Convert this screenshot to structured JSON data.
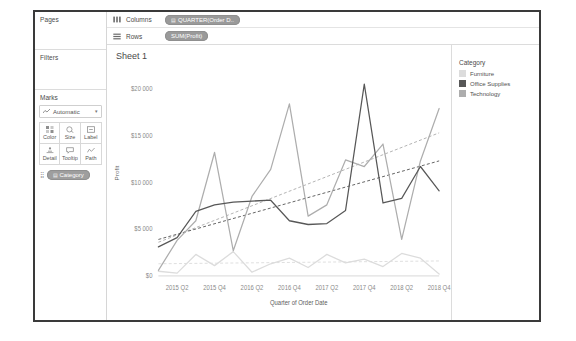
{
  "left_panel": {
    "pages_label": "Pages",
    "filters_label": "Filters",
    "marks_label": "Marks",
    "mark_type": "Automatic",
    "mark_type_icon": "line-mark-icon",
    "buttons": [
      {
        "label": "Color",
        "icon": "color-icon"
      },
      {
        "label": "Size",
        "icon": "size-icon"
      },
      {
        "label": "Label",
        "icon": "label-icon"
      },
      {
        "label": "Detail",
        "icon": "detail-icon"
      },
      {
        "label": "Tooltip",
        "icon": "tooltip-icon"
      },
      {
        "label": "Path",
        "icon": "path-icon"
      }
    ],
    "mark_pill": {
      "label": "Category",
      "icon": "dimension-icon",
      "handle_icon": "drag-handle-icon"
    }
  },
  "shelves": {
    "columns": {
      "name": "Columns",
      "icon": "columns-icon",
      "pill": "QUARTER(Order D..",
      "pill_icon": "date-icon"
    },
    "rows": {
      "name": "Rows",
      "icon": "rows-icon",
      "pill": "SUM(Profit)",
      "pill_icon": "measure-icon"
    }
  },
  "view": {
    "sheet_title": "Sheet 1"
  },
  "legend": {
    "title": "Category",
    "items": [
      {
        "label": "Furniture",
        "color": "#dcdcdc"
      },
      {
        "label": "Office Supplies",
        "color": "#575757"
      },
      {
        "label": "Technology",
        "color": "#adadad"
      }
    ]
  },
  "chart_data": {
    "type": "line",
    "title": "Sheet 1",
    "xlabel": "Quarter of Order Date",
    "ylabel": "Profit",
    "ylim": [
      0,
      22000
    ],
    "yticks": [
      0,
      5000,
      10000,
      15000,
      20000
    ],
    "ytick_labels": [
      "$0",
      "$5 000",
      "$10 000",
      "$15 000",
      "$20 000"
    ],
    "grid": false,
    "legend_position": "right",
    "x": [
      "2015 Q1",
      "2015 Q2",
      "2015 Q3",
      "2015 Q4",
      "2016 Q1",
      "2016 Q2",
      "2016 Q3",
      "2016 Q4",
      "2017 Q1",
      "2017 Q2",
      "2017 Q3",
      "2017 Q4",
      "2018 Q1",
      "2018 Q2",
      "2018 Q3",
      "2018 Q4"
    ],
    "xtick_labels": [
      "2015 Q2",
      "2015 Q4",
      "2016 Q2",
      "2016 Q4",
      "2017 Q2",
      "2017 Q4",
      "2018 Q2",
      "2018 Q4"
    ],
    "series": [
      {
        "name": "Furniture",
        "color": "#dcdcdc",
        "values": [
          500,
          300,
          2300,
          1100,
          2600,
          400,
          1300,
          1900,
          900,
          2300,
          1400,
          1800,
          1000,
          2400,
          1900,
          200
        ]
      },
      {
        "name": "Office Supplies",
        "color": "#575757",
        "values": [
          3100,
          4100,
          6900,
          7600,
          7900,
          8000,
          8100,
          5900,
          5500,
          5600,
          7000,
          20500,
          7800,
          8300,
          11700,
          9100
        ]
      },
      {
        "name": "Technology",
        "color": "#adadad",
        "values": [
          600,
          3800,
          5900,
          13200,
          2700,
          8500,
          11400,
          18400,
          6400,
          7600,
          12400,
          11700,
          14100,
          3900,
          12300,
          17900
        ]
      }
    ],
    "trend_lines": [
      {
        "name": "Technology trend",
        "color": "#adadad",
        "style": "dashed",
        "y_start": 3600,
        "y_end": 15300
      },
      {
        "name": "Office Supplies trend",
        "color": "#575757",
        "style": "dashed",
        "y_start": 3900,
        "y_end": 12300
      },
      {
        "name": "Furniture trend",
        "color": "#dcdcdc",
        "style": "dashed",
        "y_start": 1300,
        "y_end": 1600
      }
    ]
  }
}
